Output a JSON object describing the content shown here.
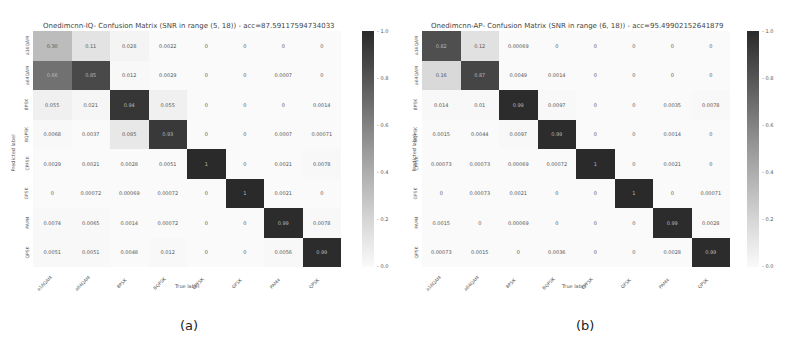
{
  "chart_data": [
    {
      "type": "heatmap",
      "panel": "(a)",
      "title": "Onedimcnn-IQ- Confusion Matrix (SNR in range (5, 18)) - acc=87.59117594734033",
      "xlabel": "True label",
      "ylabel": "Predicted label",
      "categories": [
        "a16QAM",
        "a64QAM",
        "8PSK",
        "BQPSK",
        "CPFSK",
        "GFSK",
        "PAM4",
        "QPSK"
      ],
      "colorbar": {
        "min": 0.0,
        "max": 1.0,
        "ticks": [
          "1.0",
          "0.8",
          "0.6",
          "0.4",
          "0.2",
          "0.0"
        ]
      },
      "matrix": [
        [
          "0.30",
          "0.11",
          "0.028",
          "0.0022",
          "0",
          "0",
          "0",
          "0"
        ],
        [
          "0.66",
          "0.85",
          "0.012",
          "0.0029",
          "0",
          "0",
          "0.0007",
          "0"
        ],
        [
          "0.055",
          "0.021",
          "0.94",
          "0.055",
          "0",
          "0",
          "0",
          "0.0014"
        ],
        [
          "0.0068",
          "0.0037",
          "0.085",
          "0.93",
          "0",
          "0",
          "0.0007",
          "0.00071"
        ],
        [
          "0.0029",
          "0.0021",
          "0.0028",
          "0.0051",
          "1",
          "0",
          "0.0021",
          "0.0078"
        ],
        [
          "0",
          "0.00072",
          "0.00069",
          "0.00072",
          "0",
          "1",
          "0.0021",
          "0"
        ],
        [
          "0.0074",
          "0.0065",
          "0.0014",
          "0.00072",
          "0",
          "0",
          "0.99",
          "0.0078"
        ],
        [
          "0.0051",
          "0.0051",
          "0.0048",
          "0.012",
          "0",
          "0",
          "0.0056",
          "0.99"
        ]
      ],
      "shade": [
        [
          0.3,
          0.11,
          0.03,
          0,
          0,
          0,
          0,
          0
        ],
        [
          0.66,
          0.85,
          0.01,
          0,
          0,
          0,
          0,
          0
        ],
        [
          0.05,
          0.02,
          0.94,
          0.05,
          0,
          0,
          0,
          0
        ],
        [
          0.01,
          0,
          0.085,
          0.93,
          0,
          0,
          0,
          0
        ],
        [
          0,
          0,
          0,
          0,
          1,
          0,
          0,
          0.01
        ],
        [
          0,
          0,
          0,
          0,
          0,
          1,
          0,
          0
        ],
        [
          0.01,
          0.01,
          0,
          0,
          0,
          0,
          0.99,
          0.01
        ],
        [
          0.01,
          0.01,
          0,
          0.01,
          0,
          0,
          0.01,
          0.99
        ]
      ]
    },
    {
      "type": "heatmap",
      "panel": "(b)",
      "title": "Onedimcnn-AP- Confusion Matrix (SNR in range (6, 18)) - acc=95.49902152641879",
      "xlabel": "True label",
      "ylabel": "Predicted label",
      "categories": [
        "a16QAM",
        "a64QAM",
        "8PSK",
        "BQPSK",
        "CPFSK",
        "GFSK",
        "PAM4",
        "QPSK"
      ],
      "colorbar": {
        "min": 0.0,
        "max": 1.0,
        "ticks": [
          "1.0",
          "0.8",
          "0.6",
          "0.4",
          "0.2",
          "0.0"
        ]
      },
      "matrix": [
        [
          "0.82",
          "0.12",
          "0.00069",
          "0",
          "0",
          "0",
          "0",
          "0"
        ],
        [
          "0.16",
          "0.87",
          "0.0049",
          "0.0014",
          "0",
          "0",
          "0",
          "0"
        ],
        [
          "0.014",
          "0.01",
          "0.99",
          "0.0097",
          "0",
          "0",
          "0.0035",
          "0.0078"
        ],
        [
          "0.0015",
          "0.0044",
          "0.0097",
          "0.99",
          "0",
          "0",
          "0.0014",
          "0"
        ],
        [
          "0.00073",
          "0.00073",
          "0.00069",
          "0.00072",
          "1",
          "0",
          "0.0021",
          "0"
        ],
        [
          "0",
          "0.00073",
          "0.0021",
          "0",
          "0",
          "1",
          "0",
          "0.00071"
        ],
        [
          "0.0015",
          "0",
          "0.00069",
          "0",
          "0",
          "0",
          "0.99",
          "0.0028"
        ],
        [
          "0.00073",
          "0.0015",
          "0",
          "0.0036",
          "0",
          "0",
          "0.0028",
          "0.99"
        ]
      ],
      "shade": [
        [
          0.82,
          0.12,
          0,
          0,
          0,
          0,
          0,
          0
        ],
        [
          0.16,
          0.87,
          0,
          0,
          0,
          0,
          0,
          0
        ],
        [
          0.01,
          0.01,
          0.99,
          0.01,
          0,
          0,
          0,
          0.01
        ],
        [
          0,
          0,
          0.01,
          0.99,
          0,
          0,
          0,
          0
        ],
        [
          0,
          0,
          0,
          0,
          1,
          0,
          0,
          0
        ],
        [
          0,
          0,
          0,
          0,
          0,
          1,
          0,
          0
        ],
        [
          0,
          0,
          0,
          0,
          0,
          0,
          0.99,
          0
        ],
        [
          0,
          0,
          0,
          0,
          0,
          0,
          0,
          0.99
        ]
      ]
    }
  ],
  "captions": {
    "a": "(a)",
    "b": "(b)"
  }
}
